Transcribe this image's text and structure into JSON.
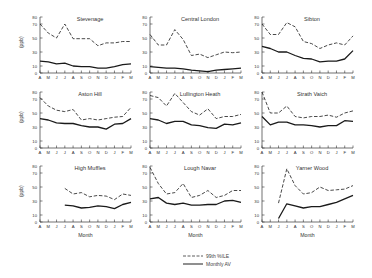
{
  "chart_data": [
    {
      "type": "line",
      "title": "Stevenage",
      "xlabel": "",
      "ylabel": "(ppb)",
      "categories": [
        "A",
        "M",
        "J",
        "J",
        "A",
        "S",
        "O",
        "N",
        "D",
        "J",
        "F",
        "M"
      ],
      "ylim": [
        0,
        80
      ],
      "yticks": [
        0,
        10,
        30,
        50,
        70,
        80
      ],
      "series": [
        {
          "name": "99th %ILE",
          "values": [
            70,
            57,
            50,
            70,
            49,
            49,
            49,
            39,
            43,
            43,
            45,
            45
          ]
        },
        {
          "name": "Monthly AV",
          "values": [
            17,
            16,
            13,
            14,
            10,
            9,
            9,
            7,
            7,
            9,
            12,
            13
          ]
        }
      ]
    },
    {
      "type": "line",
      "title": "Central London",
      "xlabel": "",
      "ylabel": "",
      "categories": [
        "A",
        "M",
        "J",
        "J",
        "A",
        "S",
        "O",
        "N",
        "D",
        "J",
        "F",
        "M"
      ],
      "ylim": [
        0,
        80
      ],
      "yticks": [
        0,
        10,
        30,
        50,
        70,
        80
      ],
      "series": [
        {
          "name": "99th %ILE",
          "values": [
            55,
            40,
            40,
            62,
            48,
            25,
            27,
            22,
            26,
            30,
            29,
            30
          ]
        },
        {
          "name": "Monthly AV",
          "values": [
            9,
            8,
            7,
            7,
            6,
            4,
            3,
            2,
            4,
            5,
            6,
            7
          ]
        }
      ]
    },
    {
      "type": "line",
      "title": "Sibton",
      "xlabel": "",
      "ylabel": "",
      "categories": [
        "A",
        "M",
        "J",
        "J",
        "A",
        "S",
        "O",
        "N",
        "D",
        "J",
        "F",
        "M"
      ],
      "ylim": [
        0,
        80
      ],
      "yticks": [
        0,
        10,
        30,
        50,
        70,
        80
      ],
      "series": [
        {
          "name": "99th %ILE",
          "values": [
            70,
            55,
            55,
            72,
            66,
            45,
            42,
            35,
            40,
            43,
            40,
            53
          ]
        },
        {
          "name": "Monthly AV",
          "values": [
            38,
            35,
            30,
            30,
            25,
            21,
            20,
            16,
            17,
            17,
            20,
            32
          ]
        }
      ]
    },
    {
      "type": "line",
      "title": "Aston Hill",
      "xlabel": "",
      "ylabel": "(ppb)",
      "categories": [
        "A",
        "M",
        "J",
        "J",
        "A",
        "S",
        "O",
        "N",
        "D",
        "J",
        "F",
        "M"
      ],
      "ylim": [
        0,
        80
      ],
      "yticks": [
        0,
        10,
        30,
        50,
        70,
        80
      ],
      "series": [
        {
          "name": "99th %ILE",
          "values": [
            72,
            60,
            54,
            52,
            55,
            40,
            42,
            40,
            42,
            44,
            45,
            58
          ]
        },
        {
          "name": "Monthly AV",
          "values": [
            42,
            40,
            36,
            35,
            35,
            32,
            30,
            30,
            27,
            34,
            35,
            42
          ]
        }
      ]
    },
    {
      "type": "line",
      "title": "Lullington Heath",
      "xlabel": "",
      "ylabel": "",
      "categories": [
        "A",
        "M",
        "J",
        "J",
        "A",
        "S",
        "O",
        "N",
        "D",
        "J",
        "F",
        "M"
      ],
      "ylim": [
        0,
        80
      ],
      "yticks": [
        0,
        10,
        30,
        50,
        70,
        80
      ],
      "series": [
        {
          "name": "99th %ILE",
          "values": [
            75,
            72,
            60,
            78,
            65,
            52,
            47,
            56,
            42,
            45,
            45,
            48
          ]
        },
        {
          "name": "Monthly AV",
          "values": [
            42,
            40,
            35,
            38,
            38,
            33,
            32,
            29,
            28,
            34,
            33,
            36
          ]
        }
      ]
    },
    {
      "type": "line",
      "title": "Strath Vaich",
      "xlabel": "",
      "ylabel": "",
      "categories": [
        "A",
        "M",
        "J",
        "J",
        "A",
        "S",
        "O",
        "N",
        "D",
        "J",
        "F",
        "M"
      ],
      "ylim": [
        0,
        80
      ],
      "yticks": [
        0,
        10,
        30,
        50,
        70,
        80
      ],
      "series": [
        {
          "name": "99th %ILE",
          "values": [
            80,
            50,
            50,
            60,
            45,
            43,
            45,
            45,
            47,
            44,
            50,
            53
          ]
        },
        {
          "name": "Monthly AV",
          "values": [
            45,
            33,
            37,
            37,
            33,
            33,
            32,
            30,
            32,
            32,
            39,
            38
          ]
        }
      ]
    },
    {
      "type": "line",
      "title": "High Muffles",
      "xlabel": "Month",
      "ylabel": "(ppb)",
      "categories": [
        "A",
        "M",
        "J",
        "J",
        "A",
        "S",
        "O",
        "N",
        "D",
        "J",
        "F",
        "M"
      ],
      "ylim": [
        0,
        80
      ],
      "yticks": [
        0,
        10,
        30,
        50,
        70,
        80
      ],
      "series": [
        {
          "name": "99th %ILE",
          "values": [
            null,
            null,
            null,
            48,
            40,
            42,
            36,
            38,
            37,
            32,
            40,
            38
          ]
        },
        {
          "name": "Monthly AV",
          "values": [
            null,
            null,
            null,
            24,
            23,
            20,
            21,
            23,
            22,
            19,
            25,
            28
          ]
        }
      ]
    },
    {
      "type": "line",
      "title": "Lough Navar",
      "xlabel": "Month",
      "ylabel": "",
      "categories": [
        "A",
        "M",
        "J",
        "J",
        "A",
        "S",
        "O",
        "N",
        "D",
        "J",
        "F",
        "M"
      ],
      "ylim": [
        0,
        80
      ],
      "yticks": [
        0,
        10,
        30,
        50,
        70,
        80
      ],
      "series": [
        {
          "name": "99th %ILE",
          "values": [
            78,
            55,
            40,
            42,
            55,
            35,
            38,
            45,
            35,
            38,
            45,
            45
          ]
        },
        {
          "name": "Monthly AV",
          "values": [
            33,
            35,
            27,
            25,
            27,
            24,
            24,
            25,
            25,
            30,
            31,
            28
          ]
        }
      ]
    },
    {
      "type": "line",
      "title": "Yarner Wood",
      "xlabel": "Month",
      "ylabel": "",
      "categories": [
        "A",
        "M",
        "J",
        "J",
        "A",
        "S",
        "O",
        "N",
        "D",
        "J",
        "F",
        "M"
      ],
      "ylim": [
        0,
        80
      ],
      "yticks": [
        0,
        10,
        30,
        50,
        70,
        80
      ],
      "series": [
        {
          "name": "99th %ILE",
          "values": [
            null,
            null,
            27,
            76,
            52,
            40,
            42,
            50,
            45,
            46,
            47,
            52
          ]
        },
        {
          "name": "Monthly AV",
          "values": [
            null,
            null,
            5,
            26,
            23,
            20,
            22,
            22,
            25,
            28,
            33,
            38
          ]
        }
      ]
    }
  ],
  "legend": {
    "items": [
      {
        "label": "99th %ILE",
        "style": "dashed"
      },
      {
        "label": "Monthly AV",
        "style": "solid"
      }
    ]
  },
  "colors": {
    "line": "#1a1a1a",
    "axis": "#333333",
    "text": "#333333"
  }
}
